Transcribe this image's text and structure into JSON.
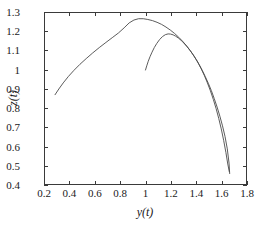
{
  "chart_data": {
    "type": "line",
    "title": "",
    "subtitle": "",
    "xlabel": "y(t)",
    "ylabel": "z(t)",
    "xlim": [
      0.2,
      1.8
    ],
    "ylim": [
      0.4,
      1.3
    ],
    "xticks": [
      "0.2",
      "0.4",
      "0.6",
      "0.8",
      "1",
      "1.2",
      "1.4",
      "1.6",
      "1.8"
    ],
    "xtick_values": [
      0.2,
      0.4,
      0.6,
      0.8,
      1.0,
      1.2,
      1.4,
      1.6,
      1.8
    ],
    "yticks": [
      "0.4",
      "0.5",
      "0.6",
      "0.7",
      "0.8",
      "0.9",
      "1",
      "1.1",
      "1.2",
      "1.3"
    ],
    "ytick_values": [
      0.4,
      0.5,
      0.6,
      0.7,
      0.8,
      0.9,
      1.0,
      1.1,
      1.2,
      1.3
    ],
    "grid": false,
    "legend": null,
    "legend_position": "none",
    "annotations": [],
    "line_color": "#4a4a4a",
    "background_color": "#ffffff",
    "frame_color": "#3a3a3a",
    "series": [
      {
        "name": "trajectory-outer",
        "x": [
          0.28,
          0.31,
          0.345,
          0.385,
          0.43,
          0.478,
          0.528,
          0.58,
          0.632,
          0.685,
          0.735,
          0.785,
          0.83,
          0.87,
          0.908,
          0.945,
          0.982,
          1.018,
          1.055,
          1.092,
          1.128,
          1.163,
          1.198,
          1.232,
          1.265,
          1.297,
          1.328,
          1.358,
          1.387,
          1.415,
          1.442,
          1.468,
          1.493,
          1.517,
          1.54,
          1.562,
          1.583,
          1.603,
          1.622,
          1.64,
          1.655,
          1.667
        ],
        "y": [
          0.87,
          0.9,
          0.932,
          0.965,
          0.998,
          1.03,
          1.06,
          1.09,
          1.118,
          1.145,
          1.17,
          1.195,
          1.222,
          1.248,
          1.263,
          1.27,
          1.27,
          1.266,
          1.26,
          1.251,
          1.24,
          1.226,
          1.21,
          1.192,
          1.172,
          1.15,
          1.126,
          1.1,
          1.072,
          1.042,
          1.008,
          0.972,
          0.932,
          0.89,
          0.845,
          0.797,
          0.745,
          0.69,
          0.63,
          0.566,
          0.505,
          0.465
        ]
      },
      {
        "name": "trajectory-inner",
        "x": [
          1.0,
          1.01,
          1.022,
          1.036,
          1.052,
          1.07,
          1.09,
          1.112,
          1.135,
          1.158,
          1.18,
          1.2,
          1.22,
          1.24,
          1.262,
          1.285,
          1.308,
          1.332,
          1.356,
          1.38,
          1.404,
          1.428,
          1.452,
          1.476,
          1.5,
          1.524,
          1.547,
          1.57,
          1.592,
          1.613,
          1.633,
          1.651,
          1.665,
          1.67
        ],
        "y": [
          1.0,
          1.022,
          1.046,
          1.07,
          1.094,
          1.118,
          1.14,
          1.16,
          1.176,
          1.186,
          1.19,
          1.189,
          1.185,
          1.178,
          1.168,
          1.155,
          1.14,
          1.122,
          1.102,
          1.08,
          1.055,
          1.028,
          0.998,
          0.965,
          0.93,
          0.892,
          0.85,
          0.805,
          0.757,
          0.706,
          0.65,
          0.585,
          0.51,
          0.455
        ]
      }
    ]
  }
}
